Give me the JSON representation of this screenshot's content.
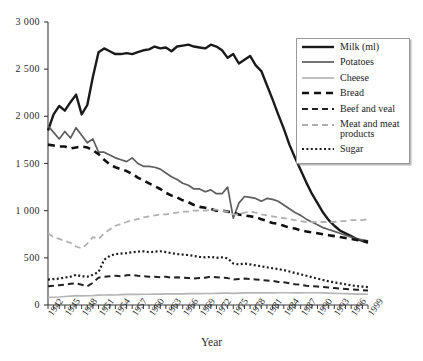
{
  "chart_data": {
    "type": "line",
    "title": "",
    "xlabel": "Year",
    "ylabel": "",
    "xlim": [
      1942,
      1999
    ],
    "ylim": [
      0,
      3000
    ],
    "yticks": [
      0,
      500,
      1000,
      1500,
      2000,
      2500,
      3000
    ],
    "ytick_labels": [
      "0",
      "500",
      "1 000",
      "1 500",
      "2 000",
      "2 500",
      "3 000"
    ],
    "xtick_labels": [
      "1942",
      "1945",
      "1948",
      "1951",
      "1954",
      "1957",
      "1960",
      "1963",
      "1966",
      "1969",
      "1972",
      "1975",
      "1978",
      "1981",
      "1984",
      "1987",
      "1990",
      "1993",
      "1996",
      "1999"
    ],
    "xtick_step": 3,
    "grid": false,
    "legend_position": "upper-right",
    "x": [
      1942,
      1943,
      1944,
      1945,
      1946,
      1947,
      1948,
      1949,
      1950,
      1951,
      1952,
      1953,
      1954,
      1955,
      1956,
      1957,
      1958,
      1959,
      1960,
      1961,
      1962,
      1963,
      1964,
      1965,
      1966,
      1967,
      1968,
      1969,
      1970,
      1971,
      1972,
      1973,
      1974,
      1975,
      1976,
      1977,
      1978,
      1979,
      1980,
      1981,
      1982,
      1983,
      1984,
      1985,
      1986,
      1987,
      1988,
      1989,
      1990,
      1991,
      1992,
      1993,
      1994,
      1995,
      1996,
      1997,
      1998,
      1999
    ],
    "series": [
      {
        "name": "Milk (ml)",
        "color": "#1a1a1a",
        "style": "solid",
        "width": 2.4,
        "values": [
          1850,
          2020,
          2110,
          2060,
          2150,
          2230,
          2020,
          2120,
          2420,
          2680,
          2720,
          2690,
          2660,
          2660,
          2670,
          2660,
          2680,
          2700,
          2710,
          2740,
          2720,
          2730,
          2690,
          2740,
          2750,
          2760,
          2740,
          2730,
          2720,
          2760,
          2740,
          2700,
          2620,
          2660,
          2560,
          2600,
          2640,
          2540,
          2480,
          2330,
          2180,
          2020,
          1870,
          1700,
          1560,
          1430,
          1300,
          1180,
          1080,
          980,
          900,
          840,
          790,
          760,
          730,
          700,
          680,
          660
        ]
      },
      {
        "name": "Potatoes",
        "color": "#5d5d5d",
        "style": "solid",
        "width": 1.7,
        "values": [
          1900,
          1830,
          1760,
          1840,
          1770,
          1880,
          1800,
          1720,
          1760,
          1620,
          1620,
          1590,
          1560,
          1540,
          1520,
          1560,
          1500,
          1470,
          1470,
          1460,
          1440,
          1400,
          1360,
          1330,
          1290,
          1270,
          1230,
          1230,
          1200,
          1220,
          1180,
          1180,
          1250,
          920,
          1080,
          1150,
          1140,
          1130,
          1100,
          1130,
          1120,
          1100,
          1060,
          1020,
          980,
          950,
          910,
          880,
          850,
          820,
          800,
          780,
          760,
          740,
          720,
          700,
          690,
          680
        ]
      },
      {
        "name": "Cheese",
        "color": "#b5b5b5",
        "style": "solid",
        "width": 1.7,
        "values": [
          80,
          82,
          85,
          90,
          95,
          100,
          96,
          98,
          100,
          104,
          106,
          108,
          106,
          110,
          112,
          112,
          112,
          114,
          114,
          116,
          116,
          118,
          118,
          118,
          118,
          120,
          120,
          120,
          122,
          122,
          124,
          126,
          126,
          124,
          126,
          128,
          130,
          128,
          128,
          128,
          128,
          130,
          130,
          130,
          128,
          128,
          130,
          130,
          130,
          128,
          126,
          124,
          122,
          120,
          118,
          116,
          115,
          114
        ]
      },
      {
        "name": "Bread",
        "color": "#111111",
        "style": "dashed",
        "dash": "7,5",
        "width": 2.6,
        "values": [
          1700,
          1690,
          1680,
          1680,
          1660,
          1670,
          1680,
          1670,
          1640,
          1600,
          1540,
          1490,
          1460,
          1440,
          1420,
          1390,
          1350,
          1320,
          1290,
          1260,
          1230,
          1190,
          1160,
          1140,
          1110,
          1090,
          1060,
          1040,
          1030,
          1020,
          1000,
          1000,
          990,
          980,
          960,
          950,
          940,
          930,
          910,
          890,
          870,
          860,
          840,
          820,
          810,
          790,
          780,
          770,
          760,
          750,
          740,
          730,
          720,
          710,
          700,
          690,
          680,
          670
        ]
      },
      {
        "name": "Beef and veal",
        "color": "#222222",
        "style": "dashed",
        "dash": "6,4",
        "width": 2.0,
        "values": [
          200,
          205,
          210,
          215,
          225,
          230,
          215,
          200,
          235,
          290,
          300,
          305,
          310,
          305,
          315,
          320,
          310,
          305,
          300,
          300,
          295,
          300,
          290,
          295,
          290,
          285,
          280,
          285,
          290,
          300,
          295,
          290,
          285,
          270,
          275,
          280,
          275,
          270,
          265,
          260,
          255,
          245,
          240,
          230,
          220,
          215,
          205,
          200,
          195,
          190,
          185,
          180,
          175,
          170,
          165,
          162,
          158,
          155
        ]
      },
      {
        "name": "Meat and meat products",
        "color": "#b0b0b0",
        "style": "dashed",
        "dash": "6,4",
        "width": 1.8,
        "values": [
          760,
          720,
          700,
          680,
          660,
          620,
          600,
          650,
          720,
          700,
          760,
          800,
          840,
          860,
          880,
          900,
          910,
          930,
          940,
          950,
          960,
          960,
          970,
          980,
          990,
          990,
          1000,
          1000,
          1000,
          1010,
          1010,
          1000,
          990,
          960,
          960,
          980,
          990,
          980,
          960,
          950,
          940,
          930,
          920,
          910,
          900,
          890,
          880,
          880,
          880,
          880,
          880,
          880,
          890,
          890,
          900,
          900,
          900,
          910
        ]
      },
      {
        "name": "Sugar",
        "color": "#1f1f1f",
        "style": "dotted",
        "dash": "2,2.4",
        "width": 2.2,
        "values": [
          270,
          275,
          280,
          290,
          300,
          320,
          305,
          300,
          320,
          350,
          480,
          520,
          540,
          545,
          550,
          560,
          565,
          570,
          560,
          565,
          570,
          560,
          550,
          540,
          535,
          530,
          520,
          510,
          505,
          510,
          500,
          505,
          495,
          440,
          430,
          440,
          430,
          420,
          410,
          400,
          390,
          380,
          370,
          355,
          340,
          325,
          310,
          295,
          280,
          265,
          250,
          240,
          230,
          220,
          210,
          200,
          195,
          190
        ]
      }
    ]
  },
  "legend": {
    "items": [
      {
        "label": "Milk (ml)",
        "icon": "line-swatch-solid-black"
      },
      {
        "label": "Potatoes",
        "icon": "line-swatch-solid-gray"
      },
      {
        "label": "Cheese",
        "icon": "line-swatch-solid-lightgray"
      },
      {
        "label": "Bread",
        "icon": "line-swatch-dashed-black"
      },
      {
        "label": "Beef and veal",
        "icon": "line-swatch-dashed-black-thin"
      },
      {
        "label": "Meat and meat products",
        "icon": "line-swatch-dashed-lightgray"
      },
      {
        "label": "Sugar",
        "icon": "line-swatch-dotted-black"
      }
    ]
  },
  "axes": {
    "x_title": "Year",
    "axis_color": "#3a3a3a"
  }
}
